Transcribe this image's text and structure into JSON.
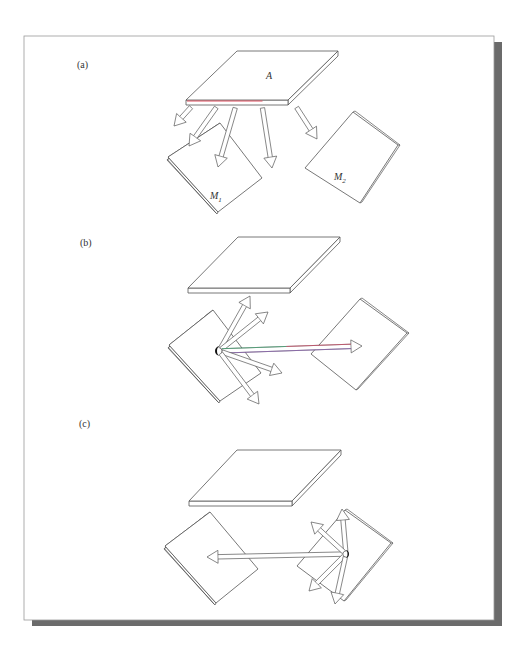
{
  "figure": {
    "frame": {
      "x": 24,
      "y": 36,
      "w": 470,
      "h": 584,
      "border_color": "#9a9a9a",
      "shadow_color": "#6b6b6b",
      "shadow_offset": 8
    },
    "colors": {
      "line": "#555555",
      "fill": "#ffffff",
      "red_edge": "#e05060",
      "fringe_purple": "#8a5ab8",
      "fringe_green": "#3aa870",
      "fringe_red": "#d84060",
      "source_dot": "#111111"
    },
    "panels": [
      {
        "id": "a",
        "label": "(a)",
        "label_pos": [
          77,
          68
        ],
        "emitter": {
          "label": "A",
          "label_pos": [
            266,
            79
          ],
          "top": [
            [
              237,
              51
            ],
            [
              338,
              51
            ],
            [
              288,
              100
            ],
            [
              186,
              100
            ]
          ],
          "thickness": 5,
          "red_front_edge": true
        },
        "receivers": [
          {
            "label": "M",
            "subscript": "1",
            "label_pos": [
              210,
              199
            ],
            "corners": [
              [
                220,
                123
              ],
              [
                262,
                178
              ],
              [
                218,
                212
              ],
              [
                168,
                157
              ]
            ]
          },
          {
            "label": "M",
            "subscript": "2",
            "label_pos": [
              334,
              180
            ],
            "corners": [
              [
                353,
                112
              ],
              [
                398,
                145
              ],
              [
                360,
                203
              ],
              [
                305,
                168
              ]
            ]
          }
        ],
        "arrows": [
          {
            "from": [
              193,
              105
            ],
            "to": [
              174,
              126
            ]
          },
          {
            "from": [
              218,
              105
            ],
            "to": [
              189,
              146
            ]
          },
          {
            "from": [
              236,
              105
            ],
            "to": [
              218,
              167
            ]
          },
          {
            "from": [
              262,
              105
            ],
            "to": [
              272,
              168
            ]
          },
          {
            "from": [
              295,
              105
            ],
            "to": [
              317,
              139
            ]
          }
        ]
      },
      {
        "id": "b",
        "label": "(b)",
        "label_pos": [
          80,
          246
        ],
        "emitter": {
          "label": "",
          "top": [
            [
              238,
              237
            ],
            [
              340,
              237
            ],
            [
              290,
              288
            ],
            [
              188,
              288
            ]
          ],
          "thickness": 5,
          "red_front_edge": false
        },
        "receivers": [
          {
            "label": "",
            "corners": [
              [
                213,
                310
              ],
              [
                261,
                373
              ],
              [
                220,
                401
              ],
              [
                169,
                345
              ]
            ]
          },
          {
            "label": "",
            "corners": [
              [
                360,
                299
              ],
              [
                407,
                333
              ],
              [
                356,
                390
              ],
              [
                311,
                354
              ]
            ]
          }
        ],
        "source": [
          219,
          351
        ],
        "arrows": [
          {
            "from": [
              219,
              351
            ],
            "to": [
              250,
              296
            ]
          },
          {
            "from": [
              219,
              351
            ],
            "to": [
              268,
              312
            ]
          },
          {
            "from": [
              219,
              351
            ],
            "to": [
              362,
              346
            ],
            "colored": true
          },
          {
            "from": [
              219,
              351
            ],
            "to": [
              282,
              373
            ]
          },
          {
            "from": [
              219,
              351
            ],
            "to": [
              259,
              404
            ]
          }
        ]
      },
      {
        "id": "c",
        "label": "(c)",
        "label_pos": [
          79,
          427
        ],
        "emitter": {
          "label": "",
          "top": [
            [
              237,
              450
            ],
            [
              341,
              450
            ],
            [
              292,
              501
            ],
            [
              189,
              501
            ]
          ],
          "thickness": 5,
          "red_front_edge": false
        },
        "receivers": [
          {
            "label": "",
            "corners": [
              [
                210,
                512
              ],
              [
                258,
                569
              ],
              [
                216,
                603
              ],
              [
                165,
                546
              ]
            ]
          },
          {
            "label": "",
            "corners": [
              [
                345,
                510
              ],
              [
                391,
                543
              ],
              [
                344,
                601
              ],
              [
                297,
                566
              ]
            ]
          }
        ],
        "source": [
          346,
          554
        ],
        "arrows": [
          {
            "from": [
              346,
              554
            ],
            "to": [
              207,
              557
            ]
          },
          {
            "from": [
              346,
              554
            ],
            "to": [
              342,
              509
            ]
          },
          {
            "from": [
              346,
              554
            ],
            "to": [
              311,
              522
            ]
          },
          {
            "from": [
              346,
              554
            ],
            "to": [
              309,
              591
            ]
          },
          {
            "from": [
              346,
              554
            ],
            "to": [
              335,
              604
            ]
          }
        ]
      }
    ]
  }
}
